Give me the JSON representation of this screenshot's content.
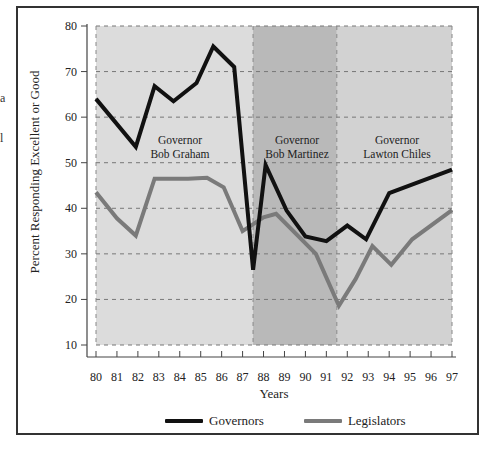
{
  "chart_data": {
    "type": "line",
    "title": "",
    "xlabel": "Years",
    "ylabel": "Percent Responding Excellent or Good",
    "x_ticks": [
      "80",
      "81",
      "82",
      "83",
      "84",
      "85",
      "86",
      "87",
      "88",
      "89",
      "90",
      "91",
      "92",
      "93",
      "94",
      "95",
      "96",
      "97"
    ],
    "y_ticks": [
      10,
      20,
      30,
      40,
      50,
      60,
      70,
      80
    ],
    "xlim": [
      80,
      97
    ],
    "ylim": [
      10,
      80
    ],
    "grid": "dashed horizontal at each y tick",
    "legend_position": "bottom",
    "regions": [
      {
        "label": "Governor Bob Graham",
        "line1": "Governor",
        "line2": "Bob Graham",
        "start": 80,
        "end": 87.5,
        "color": "#dcdcdc"
      },
      {
        "label": "Governor Bob Martinez",
        "line1": "Governor",
        "line2": "Bob Martinez",
        "start": 87.5,
        "end": 91.5,
        "color": "#b9b9b9"
      },
      {
        "label": "Governor Lawton Chiles",
        "line1": "Governor",
        "line2": "Lawton Chiles",
        "start": 91.5,
        "end": 97,
        "color": "#d2d2d2"
      }
    ],
    "series": [
      {
        "name": "Governors",
        "color": "#111111",
        "points": [
          [
            80.0,
            64
          ],
          [
            81.9,
            53.5
          ],
          [
            82.8,
            66.8
          ],
          [
            83.7,
            63.5
          ],
          [
            84.8,
            67.5
          ],
          [
            85.6,
            75.5
          ],
          [
            86.6,
            71
          ],
          [
            87.5,
            26.5
          ],
          [
            88.1,
            49.5
          ],
          [
            89.1,
            39.5
          ],
          [
            90.0,
            33.8
          ],
          [
            91.0,
            32.8
          ],
          [
            92.0,
            36.2
          ],
          [
            92.9,
            33.2
          ],
          [
            94.0,
            43.3
          ],
          [
            97.0,
            48.5
          ]
        ]
      },
      {
        "name": "Legislators",
        "color": "#7a7a7a",
        "points": [
          [
            80.0,
            43.5
          ],
          [
            81.0,
            37.8
          ],
          [
            81.9,
            34.0
          ],
          [
            82.8,
            46.5
          ],
          [
            84.4,
            46.5
          ],
          [
            85.3,
            46.7
          ],
          [
            86.1,
            44.6
          ],
          [
            87.0,
            35.0
          ],
          [
            88.0,
            38.0
          ],
          [
            88.6,
            38.8
          ],
          [
            90.5,
            30.0
          ],
          [
            91.6,
            18.6
          ],
          [
            92.4,
            24.5
          ],
          [
            93.2,
            31.7
          ],
          [
            94.1,
            27.6
          ],
          [
            95.1,
            33.2
          ],
          [
            97.0,
            39.6
          ]
        ]
      }
    ]
  },
  "left_fragments": [
    "a",
    "l"
  ],
  "legend": {
    "governors_label": "Governors",
    "legislators_label": "Legislators"
  }
}
